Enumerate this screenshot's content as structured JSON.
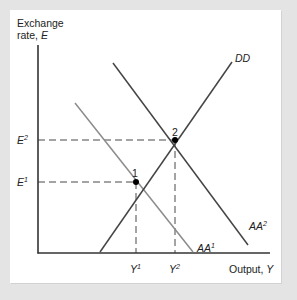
{
  "diagram": {
    "y_axis": {
      "label_line1": "Exchange",
      "label_line2": "rate, ",
      "label_var": "E"
    },
    "x_axis": {
      "label": "Output, ",
      "label_var": "Y"
    },
    "curves": [
      {
        "name": "DD",
        "label": "DD",
        "color": "#444444"
      },
      {
        "name": "AA1",
        "label": "AA",
        "sup": "1",
        "color": "#8c8c8c"
      },
      {
        "name": "AA2",
        "label": "AA",
        "sup": "2",
        "color": "#444444"
      }
    ],
    "equilibria": [
      {
        "id": "1",
        "label": "1",
        "E": "E",
        "E_sup": "1",
        "Y": "Y",
        "Y_sup": "1"
      },
      {
        "id": "2",
        "label": "2",
        "E": "E",
        "E_sup": "2",
        "Y": "Y",
        "Y_sup": "2"
      }
    ],
    "colors": {
      "background": "#e4e4e4",
      "panel": "#ffffff",
      "axis": "#333333",
      "dark_curve": "#444444",
      "light_curve": "#8c8c8c"
    }
  }
}
